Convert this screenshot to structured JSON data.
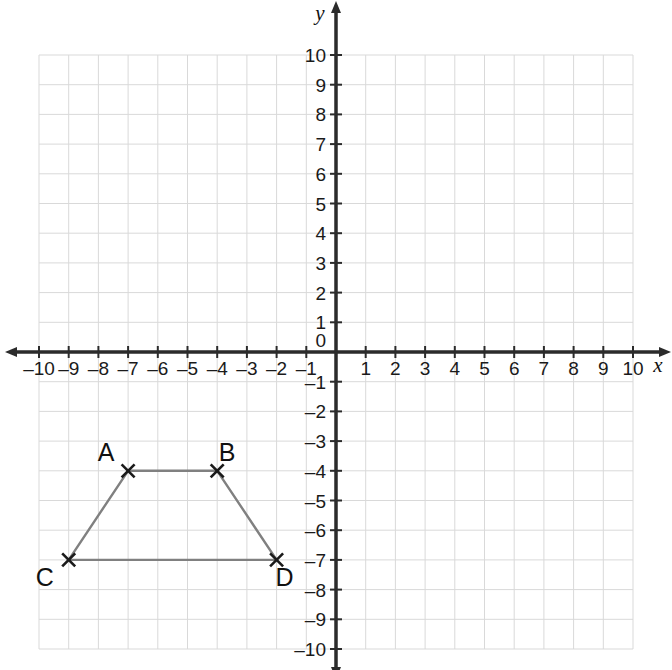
{
  "chart_data": {
    "type": "scatter",
    "title": "",
    "xlabel": "x",
    "ylabel": "y",
    "xlim": [
      -10,
      10
    ],
    "ylim": [
      -10,
      10
    ],
    "grid": true,
    "grid_step": 1,
    "legend": "none",
    "x_ticks": [
      "-10",
      "-9",
      "-8",
      "-7",
      "-6",
      "-5",
      "-4",
      "-3",
      "-2",
      "-1",
      "1",
      "2",
      "3",
      "4",
      "5",
      "6",
      "7",
      "8",
      "9",
      "10"
    ],
    "y_ticks": [
      "10",
      "9",
      "8",
      "7",
      "6",
      "5",
      "4",
      "3",
      "2",
      "1",
      "-1",
      "-2",
      "-3",
      "-4",
      "-5",
      "-6",
      "-7",
      "-8",
      "-9",
      "-10"
    ],
    "origin_label": "0",
    "points": [
      {
        "label": "A",
        "x": -7,
        "y": -4,
        "label_dx": -22,
        "label_dy": -10
      },
      {
        "label": "B",
        "x": -4,
        "y": -4,
        "label_dx": 10,
        "label_dy": -10
      },
      {
        "label": "C",
        "x": -9,
        "y": -7,
        "label_dx": -24,
        "label_dy": 26
      },
      {
        "label": "D",
        "x": -2,
        "y": -7,
        "label_dx": 8,
        "label_dy": 26
      }
    ],
    "shape": {
      "name": "trapezoid-ABDC",
      "vertex_order": [
        "A",
        "B",
        "D",
        "C"
      ],
      "closed": true,
      "fill": "none"
    },
    "marker": "x-cross",
    "colors": {
      "grid": "#d9d9d9",
      "axis": "#2b2b2b",
      "shape_stroke": "#808080",
      "marker": "#1a1a1a",
      "text": "#111111",
      "background": "#ffffff"
    }
  },
  "geometry": {
    "origin_px": {
      "x": 336,
      "y": 352
    },
    "unit_px": 29.7,
    "grid_bounds_px": {
      "left": 39,
      "right": 633,
      "top": 55,
      "bottom": 649
    }
  }
}
